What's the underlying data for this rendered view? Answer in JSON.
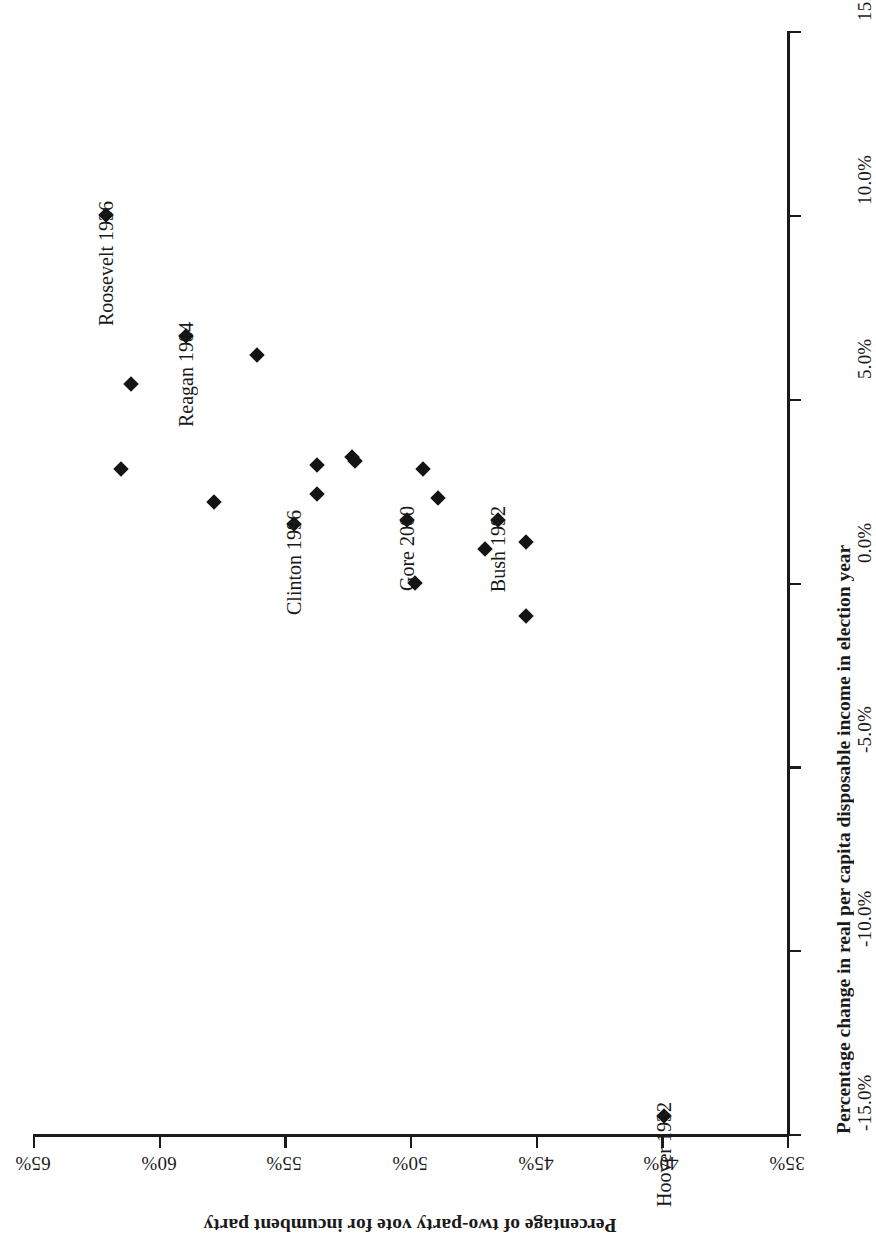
{
  "figure": {
    "orientation": "rotated-180",
    "background": "#ffffff",
    "ink_color": "#1a1a1a",
    "marker_color": "#141414",
    "marker_shape": "diamond"
  },
  "chart_data": {
    "type": "scatter",
    "title": "",
    "xlabel": "Percentage change in real per capita disposable income in election year",
    "ylabel": "Percentage of two-party vote for incumbent party",
    "xlim": [
      -15.0,
      15.0
    ],
    "ylim": [
      35,
      65
    ],
    "grid": false,
    "legend": "none",
    "x_ticks": [
      "-15.0%",
      "-10.0%",
      "-5.0%",
      "0.0%",
      "5.0%",
      "10.0%",
      "15.0%"
    ],
    "x_tick_values": [
      -15.0,
      -10.0,
      -5.0,
      0.0,
      5.0,
      10.0,
      15.0
    ],
    "y_ticks": [
      "35%",
      "40%",
      "45%",
      "50%",
      "55%",
      "60%",
      "65%"
    ],
    "y_tick_values": [
      35,
      40,
      45,
      50,
      55,
      60,
      65
    ],
    "points": [
      {
        "label": "Roosevelt 1936",
        "x": 10.0,
        "y": 62.1,
        "labeled": true
      },
      {
        "label": "Reagan 1984",
        "x": 6.7,
        "y": 58.9,
        "labeled": true
      },
      {
        "label": "Clinton 1996",
        "x": 1.6,
        "y": 54.6,
        "labeled": true
      },
      {
        "label": "Gore 2000",
        "x": 1.7,
        "y": 50.1,
        "labeled": true
      },
      {
        "label": "Bush 1992",
        "x": 1.7,
        "y": 46.5,
        "labeled": true
      },
      {
        "label": "Hoover 1932",
        "x": -14.5,
        "y": 39.9,
        "labeled": true
      },
      {
        "label": "",
        "x": 6.2,
        "y": 56.1,
        "labeled": false
      },
      {
        "label": "",
        "x": 5.4,
        "y": 61.1,
        "labeled": false
      },
      {
        "label": "",
        "x": 3.1,
        "y": 61.5,
        "labeled": false
      },
      {
        "label": "",
        "x": 2.2,
        "y": 57.8,
        "labeled": false
      },
      {
        "label": "",
        "x": 3.2,
        "y": 53.7,
        "labeled": false
      },
      {
        "label": "",
        "x": 2.4,
        "y": 53.7,
        "labeled": false
      },
      {
        "label": "",
        "x": 3.4,
        "y": 52.3,
        "labeled": false
      },
      {
        "label": "",
        "x": 3.3,
        "y": 52.2,
        "labeled": false
      },
      {
        "label": "",
        "x": 3.1,
        "y": 49.5,
        "labeled": false
      },
      {
        "label": "",
        "x": 2.3,
        "y": 48.9,
        "labeled": false
      },
      {
        "label": "",
        "x": 0.9,
        "y": 47.0,
        "labeled": false
      },
      {
        "label": "",
        "x": 0.0,
        "y": 49.8,
        "labeled": false
      },
      {
        "label": "",
        "x": 1.1,
        "y": 45.4,
        "labeled": false
      },
      {
        "label": "",
        "x": -0.9,
        "y": 45.4,
        "labeled": false
      }
    ]
  }
}
